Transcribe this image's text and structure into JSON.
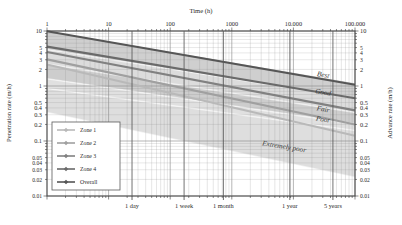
{
  "chart_data": {
    "type": "line",
    "title": "Time (h)",
    "xlabel": "Time (h)",
    "ylabel": "Penetration rate (m/h)",
    "y2label": "Advance rate (m/h)",
    "xscale": "log",
    "yscale": "log",
    "xlim": [
      1,
      100000
    ],
    "ylim": [
      0.01,
      10
    ],
    "grid": true,
    "legend_position": "left-middle",
    "x_tick_labels": [
      "1",
      "10",
      "100",
      "1000",
      "10.000",
      "100.000"
    ],
    "x_tick_values": [
      1,
      10,
      100,
      1000,
      10000,
      100000
    ],
    "y_tick_labels": [
      "10",
      "5",
      "4",
      "3",
      "2",
      "1",
      "0.5",
      "0.4",
      "0.3",
      "0.2",
      "0.1",
      "0.05",
      "0.04",
      "0.03",
      "0.02",
      "0.01"
    ],
    "y_tick_values": [
      10,
      5,
      4,
      3,
      2,
      1,
      0.5,
      0.4,
      0.3,
      0.2,
      0.1,
      0.05,
      0.04,
      0.03,
      0.02,
      0.01
    ],
    "y2_tick_labels": [
      "10",
      "5",
      "4",
      "3",
      "2",
      "1",
      "0.5",
      "0.4",
      "0.3",
      "0.2",
      "0.1",
      "0.05",
      "0.04",
      "0.03",
      "0.02",
      "0.01"
    ],
    "time_markers": [
      {
        "label": "1 day",
        "hours": 24
      },
      {
        "label": "1 week",
        "hours": 168
      },
      {
        "label": "1 month",
        "hours": 730
      },
      {
        "label": "1 year",
        "hours": 8760
      },
      {
        "label": "5 years",
        "hours": 43800
      }
    ],
    "band_labels": [
      {
        "label": "Best",
        "x": 30000,
        "y": 1.45
      },
      {
        "label": "Good",
        "x": 30000,
        "y": 0.7
      },
      {
        "label": "Fair",
        "x": 30000,
        "y": 0.345
      },
      {
        "label": "Poor",
        "x": 30000,
        "y": 0.225
      },
      {
        "label": "Extremely poor",
        "x": 7000,
        "y": 0.072
      }
    ],
    "series": [
      {
        "name": "Zone 1",
        "color": "#b9b9b9",
        "points": [
          [
            1,
            2.45
          ],
          [
            100000,
            0.125
          ]
        ]
      },
      {
        "name": "Zone 2",
        "color": "#a0a0a0",
        "points": [
          [
            1,
            3.05
          ],
          [
            100000,
            0.2
          ]
        ]
      },
      {
        "name": "Zone 3",
        "color": "#818181",
        "points": [
          [
            1,
            4.15
          ],
          [
            100000,
            0.36
          ]
        ]
      },
      {
        "name": "Zone 4",
        "color": "#6a6a6a",
        "points": [
          [
            1,
            5.2
          ],
          [
            100000,
            0.6
          ]
        ]
      },
      {
        "name": "Overall",
        "color": "#565656",
        "points": [
          [
            1,
            9.9
          ],
          [
            100000,
            1.05
          ]
        ]
      }
    ],
    "bands": [
      {
        "name": "Best",
        "y0_left": 10.0,
        "y0_right": 1.12,
        "y1_left": 4.6,
        "y1_right": 0.6,
        "fill": "#cfcfcf"
      },
      {
        "name": "Good",
        "y0_left": 4.6,
        "y0_right": 0.6,
        "y1_left": 2.5,
        "y1_right": 0.33,
        "fill": "#dcdcdc"
      },
      {
        "name": "Fair",
        "y0_left": 2.5,
        "y0_right": 0.33,
        "y1_left": 1.35,
        "y1_right": 0.205,
        "fill": "#cdcdcd"
      },
      {
        "name": "Poor",
        "y0_left": 1.35,
        "y0_right": 0.205,
        "y1_left": 0.9,
        "y1_right": 0.155,
        "fill": "#e0e0e0"
      },
      {
        "name": "Extremely poor",
        "y0_left": 0.9,
        "y0_right": 0.155,
        "y1_left": 0.33,
        "y1_right": 0.022,
        "fill": "#dedede"
      }
    ],
    "legend": [
      {
        "label": "Zone 1",
        "color": "#b9b9b9"
      },
      {
        "label": "Zone 2",
        "color": "#a0a0a0"
      },
      {
        "label": "Zone 3",
        "color": "#818181"
      },
      {
        "label": "Zone 4",
        "color": "#6a6a6a"
      },
      {
        "label": "Overall",
        "color": "#565656"
      }
    ]
  }
}
